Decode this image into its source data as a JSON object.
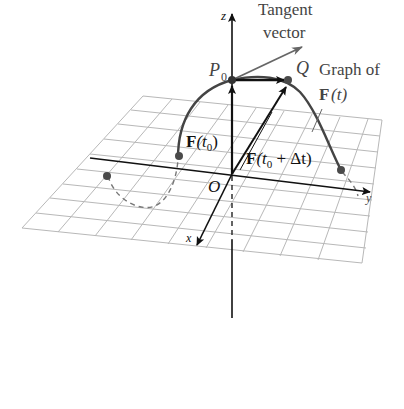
{
  "figure": {
    "labels": {
      "z_axis": "z",
      "x_axis": "x",
      "y_axis": "y",
      "origin": "O",
      "p0": "P",
      "p0_sub": "0",
      "q": "Q",
      "tangent_line1": "Tangent",
      "tangent_line2": "vector",
      "graph_line1": "Graph of",
      "graph_F": "F",
      "graph_t": "(t)",
      "f_t0_F": "F",
      "f_t0_open": "(t",
      "f_t0_sub": "0",
      "f_t0_close": ")",
      "f_t0dt_F": "F",
      "f_t0dt_open": "(t",
      "f_t0dt_sub": "0",
      "f_t0dt_rest": " + Δt)"
    },
    "colors": {
      "grid": "#b8b8b8",
      "axis": "#111111",
      "curve": "#444444",
      "dashed": "#777777",
      "point": "#4a4a4a",
      "tangent": "#666666"
    }
  }
}
